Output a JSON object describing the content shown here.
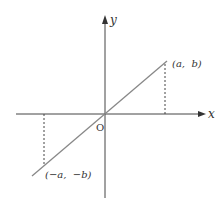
{
  "diagram": {
    "type": "coordinate-plane",
    "axes": {
      "x_label": "x",
      "y_label": "y",
      "origin_label": "O",
      "color": "#444444"
    },
    "line": {
      "description": "straight line through origin",
      "color": "#888888"
    },
    "points": [
      {
        "label": "(a,  b)",
        "name": "point-a-b"
      },
      {
        "label": "(−a,  −b)",
        "name": "point-neg-a-neg-b"
      }
    ],
    "projections": {
      "style": "dashed",
      "color": "#444444"
    }
  }
}
